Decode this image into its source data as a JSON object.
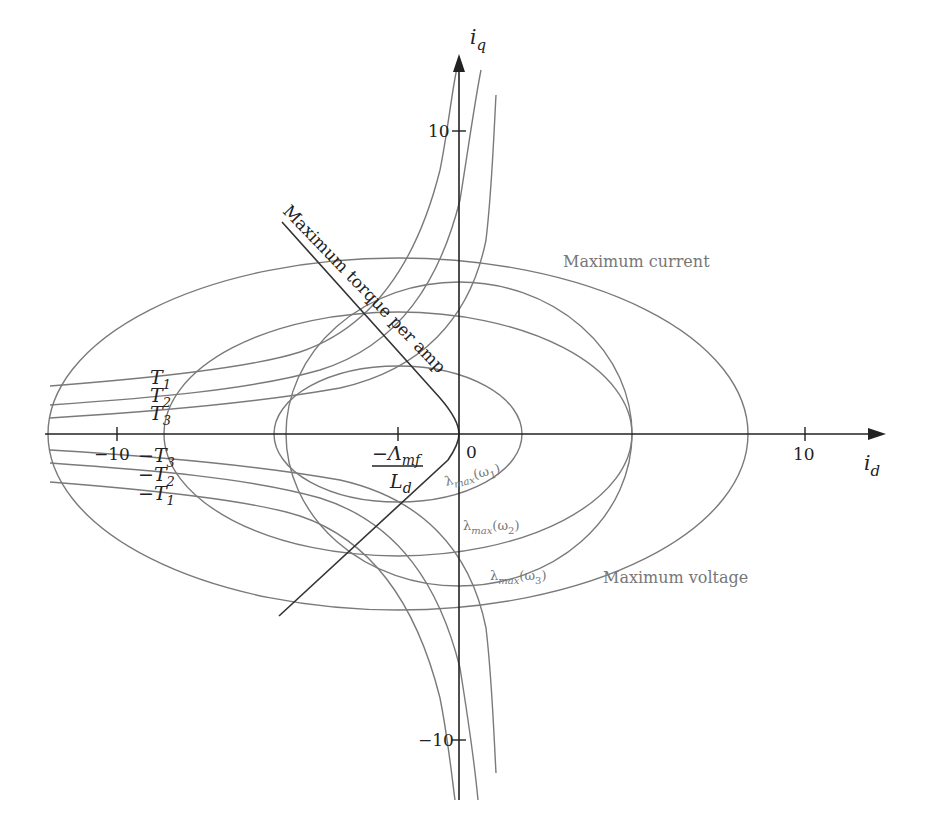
{
  "axes": {
    "x_label": "i",
    "x_label_sub": "d",
    "y_label": "i",
    "y_label_sub": "q",
    "x_ticks": [
      {
        "value": -10,
        "label": "−10"
      },
      {
        "value": 10,
        "label": "10"
      }
    ],
    "y_ticks": [
      {
        "value": 10,
        "label": "10"
      },
      {
        "value": -10,
        "label": "−10"
      }
    ],
    "origin_label": "0"
  },
  "annotations": {
    "mtpa": "Maximum torque per amp",
    "max_current": "Maximum current",
    "max_voltage": "Maximum voltage",
    "fraction_num": "−Λ",
    "fraction_num_sub": "mf",
    "fraction_den": "L",
    "fraction_den_sub": "d"
  },
  "torque_labels": {
    "positive": [
      {
        "main": "T",
        "sub": "1"
      },
      {
        "main": "T",
        "sub": "2"
      },
      {
        "main": "T",
        "sub": "3"
      }
    ],
    "negative": [
      {
        "main": "−T",
        "sub": "3"
      },
      {
        "main": "−T",
        "sub": "2"
      },
      {
        "main": "−T",
        "sub": "1"
      }
    ]
  },
  "voltage_labels": [
    {
      "main": "λ",
      "sub": "max",
      "arg": "(ω",
      "arg_sub": "1",
      "close": ")"
    },
    {
      "main": "λ",
      "sub": "max",
      "arg": "(ω",
      "arg_sub": "2",
      "close": ")"
    },
    {
      "main": "λ",
      "sub": "max",
      "arg": "(ω",
      "arg_sub": "3",
      "close": ")"
    }
  ],
  "colors": {
    "axis": "#222222",
    "curves": "#7a7a7a",
    "mtpa_line": "#333333",
    "gray_text": "#777777"
  }
}
